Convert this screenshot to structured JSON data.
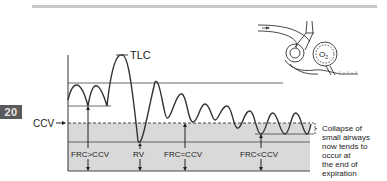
{
  "page": {
    "chapter_badge": "20"
  },
  "diagram": {
    "title_marker": "TLC",
    "ccv_label": "CCV",
    "axis_labels": {
      "frc_gt_ccv": "FRC>CCV",
      "rv": "RV",
      "frc_eq_ccv": "FRC=CCV",
      "frc_lt_ccv": "FRC<CCV"
    },
    "annotation": {
      "lines": [
        "Collapse of",
        "small airways",
        "now tends to",
        "occur at",
        "the end of",
        "expiration"
      ]
    },
    "inset": {
      "alveolus_label": "O",
      "alveolus_subscript": "2"
    },
    "colors": {
      "shade": "#d9d9d9",
      "line": "#333333",
      "topbar": "#c8c8c8",
      "badge": "#5a5a5a"
    }
  }
}
